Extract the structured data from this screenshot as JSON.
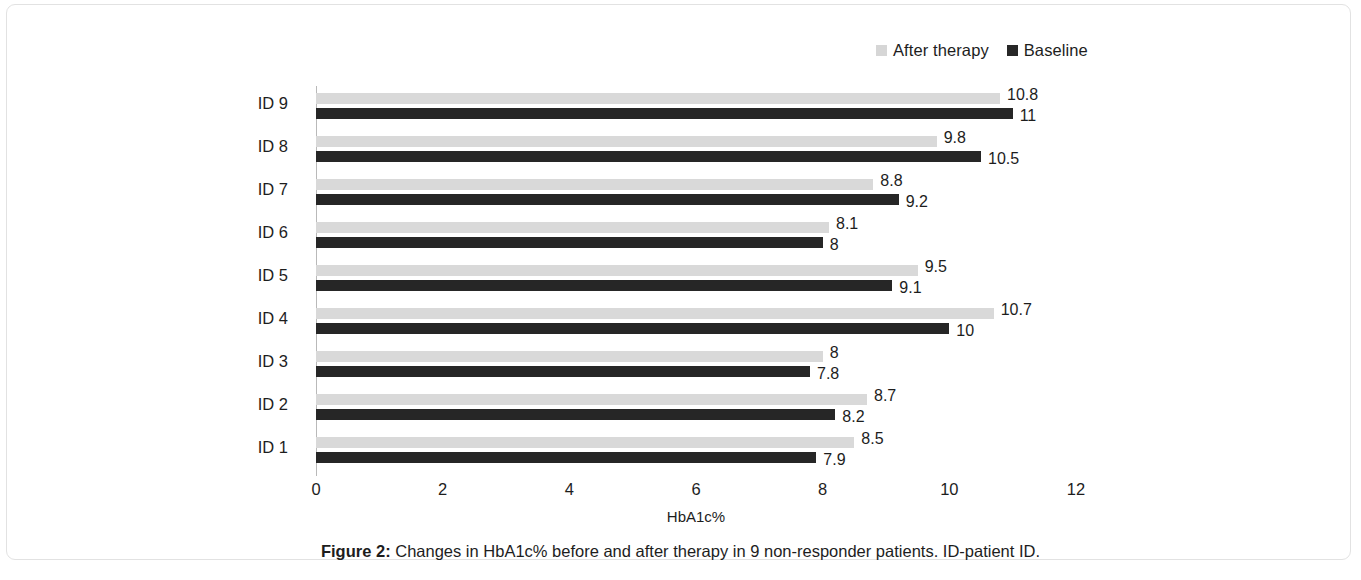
{
  "chart_data": {
    "type": "bar",
    "orientation": "horizontal",
    "title": "",
    "xlabel": "HbA1c%",
    "ylabel": "",
    "xlim": [
      0,
      12
    ],
    "xticks": [
      0,
      2,
      4,
      6,
      8,
      10,
      12
    ],
    "grid": false,
    "legend_position": "top-right",
    "categories": [
      "ID 9",
      "ID 8",
      "ID 7",
      "ID 6",
      "ID 5",
      "ID 4",
      "ID 3",
      "ID 2",
      "ID 1"
    ],
    "series": [
      {
        "name": "After therapy",
        "color": "#d9d9d9",
        "values": [
          10.8,
          9.8,
          8.8,
          8.1,
          9.5,
          10.7,
          8,
          8.7,
          8.5
        ],
        "labels": [
          "10.8",
          "9.8",
          "8.8",
          "8.1",
          "9.5",
          "10.7",
          "8",
          "8.7",
          "8.5"
        ]
      },
      {
        "name": "Baseline",
        "color": "#262626",
        "values": [
          11,
          10.5,
          9.2,
          8,
          9.1,
          10,
          7.8,
          8.2,
          7.9
        ],
        "labels": [
          "11",
          "10.5",
          "9.2",
          "8",
          "9.1",
          "10",
          "7.8",
          "8.2",
          "7.9"
        ]
      }
    ]
  },
  "caption": {
    "prefix": "Figure 2:",
    "text": " Changes in HbA1c% before and after therapy in 9 non-responder patients. ID-patient ID."
  }
}
